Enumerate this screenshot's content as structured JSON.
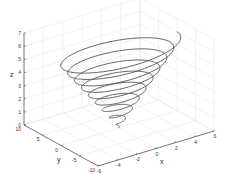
{
  "chart_data": {
    "type": "line3d",
    "title": "",
    "xlabel": "x",
    "ylabel": "y",
    "zlabel": "z",
    "xlim": [
      -6,
      6
    ],
    "ylim": [
      -10,
      10
    ],
    "zlim": [
      0,
      7
    ],
    "xticks": [
      "-6",
      "-4",
      "-2",
      "0",
      "2",
      "4",
      "6"
    ],
    "yticks": [
      "10",
      "5",
      "0",
      "-5",
      "-10"
    ],
    "zticks": [
      "0",
      "1",
      "2",
      "3",
      "4",
      "5",
      "6",
      "7"
    ],
    "grid": true,
    "series": [
      {
        "name": "spiral",
        "color": "#555555",
        "parametric": "x = t*cos(k t), y = t*sin(k t), z = t",
        "turns": 9,
        "z_range": [
          0,
          6
        ],
        "max_radius_x": 6,
        "max_radius_y": 6
      }
    ]
  },
  "colors": {
    "line": "#555555",
    "axis": "#444444",
    "grid": "#e4e4e4"
  }
}
